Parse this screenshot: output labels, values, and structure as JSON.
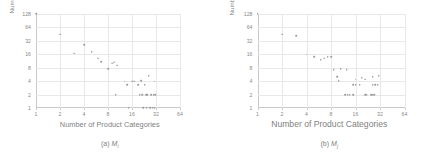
{
  "figure": {
    "panels": [
      {
        "id": "panel-a",
        "caption_prefix": "(a)",
        "caption_symbol": "M",
        "caption_subscript": "i",
        "ylabel": "Number of Vendors",
        "xlabel": "Number of Product Categories"
      },
      {
        "id": "panel-b",
        "caption_prefix": "(b)",
        "caption_symbol": "M",
        "caption_subscript": "j",
        "ylabel": "Number of Vendors",
        "xlabel": "Number of Product Categories"
      }
    ]
  },
  "colors": {
    "point": "#9a9a9a",
    "grid": "#e8e8e8",
    "axis": "#c9c9c9",
    "text": "#7f7f7f",
    "background": "#ffffff"
  },
  "chart_data": [
    {
      "type": "scatter",
      "title": "(a) Mi",
      "xlabel": "Number of Product Categories",
      "ylabel": "Number of Vendors",
      "xscale": "log2",
      "yscale": "log2",
      "xlim": [
        1,
        64
      ],
      "ylim": [
        1,
        128
      ],
      "xticks": [
        1,
        2,
        4,
        8,
        16,
        32,
        64
      ],
      "xticklabels": [
        "1",
        "2",
        "4",
        "8",
        "16",
        "32",
        "64"
      ],
      "yticks": [
        1,
        2,
        4,
        8,
        16,
        32,
        64,
        128
      ],
      "yticklabels": [
        "1",
        "2",
        "4",
        "8",
        "16",
        "32",
        "64",
        "128"
      ],
      "grid": true,
      "legend": null,
      "points": [
        {
          "x": 1,
          "y": 128
        },
        {
          "x": 2,
          "y": 45
        },
        {
          "x": 4,
          "y": 26
        },
        {
          "x": 3,
          "y": 17
        },
        {
          "x": 5,
          "y": 18
        },
        {
          "x": 6,
          "y": 13
        },
        {
          "x": 6.6,
          "y": 11
        },
        {
          "x": 8,
          "y": 7.5
        },
        {
          "x": 9,
          "y": 10
        },
        {
          "x": 9.5,
          "y": 10.5
        },
        {
          "x": 10.5,
          "y": 9
        },
        {
          "x": 13,
          "y": 4
        },
        {
          "x": 14,
          "y": 3.3
        },
        {
          "x": 16,
          "y": 4
        },
        {
          "x": 17,
          "y": 4
        },
        {
          "x": 19,
          "y": 3.3
        },
        {
          "x": 21,
          "y": 4.1
        },
        {
          "x": 23,
          "y": 3.3
        },
        {
          "x": 26,
          "y": 5.2
        },
        {
          "x": 31,
          "y": 4
        },
        {
          "x": 10,
          "y": 2
        },
        {
          "x": 20,
          "y": 2
        },
        {
          "x": 21.5,
          "y": 2
        },
        {
          "x": 24,
          "y": 2
        },
        {
          "x": 25,
          "y": 2
        },
        {
          "x": 28,
          "y": 2
        },
        {
          "x": 30,
          "y": 2
        },
        {
          "x": 31.5,
          "y": 2
        },
        {
          "x": 14.5,
          "y": 1
        },
        {
          "x": 22,
          "y": 1
        },
        {
          "x": 24.5,
          "y": 1
        },
        {
          "x": 27,
          "y": 1
        },
        {
          "x": 29,
          "y": 1
        },
        {
          "x": 31,
          "y": 1
        }
      ]
    },
    {
      "type": "scatter",
      "title": "(b) Mj",
      "xlabel": "Number of Product Categories",
      "ylabel": "Number of Vendors",
      "xscale": "log2",
      "yscale": "log2",
      "xlim": [
        1,
        64
      ],
      "ylim": [
        1,
        128
      ],
      "xticks": [
        1,
        2,
        4,
        8,
        16,
        32,
        64
      ],
      "xticklabels": [
        "1",
        "2",
        "4",
        "8",
        "16",
        "32",
        "64"
      ],
      "yticks": [
        1,
        2,
        4,
        8,
        16,
        32,
        64,
        128
      ],
      "yticklabels": [
        "1",
        "2",
        "4",
        "8",
        "16",
        "32",
        "64",
        "128"
      ],
      "grid": true,
      "legend": null,
      "points": [
        {
          "x": 1,
          "y": 128
        },
        {
          "x": 2,
          "y": 45
        },
        {
          "x": 3,
          "y": 42
        },
        {
          "x": 4,
          "y": 16
        },
        {
          "x": 5,
          "y": 14
        },
        {
          "x": 6,
          "y": 12
        },
        {
          "x": 6.6,
          "y": 13
        },
        {
          "x": 7.3,
          "y": 14
        },
        {
          "x": 8,
          "y": 14
        },
        {
          "x": 8.6,
          "y": 7.2
        },
        {
          "x": 10.5,
          "y": 7.6
        },
        {
          "x": 12.5,
          "y": 7.2
        },
        {
          "x": 9.5,
          "y": 5
        },
        {
          "x": 10,
          "y": 4.1
        },
        {
          "x": 16,
          "y": 4.4
        },
        {
          "x": 19,
          "y": 4.7
        },
        {
          "x": 21,
          "y": 4.4
        },
        {
          "x": 26,
          "y": 5
        },
        {
          "x": 31,
          "y": 5.2
        },
        {
          "x": 15,
          "y": 3.3
        },
        {
          "x": 16,
          "y": 3.3
        },
        {
          "x": 18,
          "y": 3.3
        },
        {
          "x": 26,
          "y": 3.3
        },
        {
          "x": 28,
          "y": 3.3
        },
        {
          "x": 30,
          "y": 3.3
        },
        {
          "x": 12,
          "y": 2
        },
        {
          "x": 12.8,
          "y": 2
        },
        {
          "x": 13.6,
          "y": 2
        },
        {
          "x": 15,
          "y": 2
        },
        {
          "x": 21,
          "y": 2
        },
        {
          "x": 22,
          "y": 2
        },
        {
          "x": 25,
          "y": 2
        },
        {
          "x": 26,
          "y": 2
        },
        {
          "x": 27,
          "y": 2
        }
      ]
    }
  ]
}
